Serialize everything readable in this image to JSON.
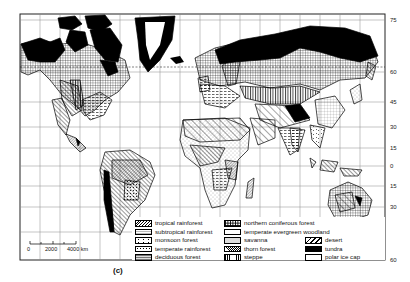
{
  "figure": {
    "caption": "(c)",
    "type": "world vegetation map (Mercator projection)"
  },
  "latitude_axis": {
    "labels": [
      {
        "value": "75",
        "y": 20
      },
      {
        "value": "60",
        "y": 72
      },
      {
        "value": "45",
        "y": 102
      },
      {
        "value": "30",
        "y": 127
      },
      {
        "value": "15",
        "y": 148
      },
      {
        "value": "0",
        "y": 166
      },
      {
        "value": "15",
        "y": 186
      },
      {
        "value": "30",
        "y": 207
      },
      {
        "value": "60",
        "y": 260
      }
    ]
  },
  "scale_bar": {
    "labels": [
      "0",
      "2000",
      "4000 km"
    ]
  },
  "legend": {
    "column1": [
      {
        "label": "tropical rainforest",
        "pattern": "diag-dense"
      },
      {
        "label": "subtropical rainforest",
        "pattern": "wavy"
      },
      {
        "label": "monsoon forest",
        "pattern": "sparse-marks"
      },
      {
        "label": "temperate rainforest",
        "pattern": "dots"
      },
      {
        "label": "deciduous forest",
        "pattern": "horiz-dashes"
      }
    ],
    "column2": [
      {
        "label": "northern coniferous forest",
        "pattern": "grid"
      },
      {
        "label": "temperate evergreen woodland",
        "pattern": "dotted-grid"
      },
      {
        "label": "savanna",
        "pattern": "light-stipple"
      },
      {
        "label": "thorn forest",
        "pattern": "dense-hatch"
      },
      {
        "label": "steppe",
        "pattern": "vertical"
      }
    ],
    "column3": [
      {
        "label": "desert",
        "pattern": "diag-wide"
      },
      {
        "label": "tundra",
        "pattern": "solid-black"
      },
      {
        "label": "polar ice cap",
        "pattern": "white"
      }
    ]
  }
}
